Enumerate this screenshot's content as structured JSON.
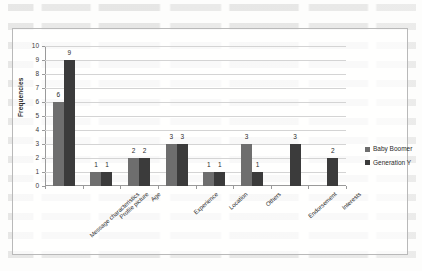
{
  "background": {
    "ghost_text_visible": true,
    "ghost_line_count": 14
  },
  "legend": {
    "position": "right",
    "entries": [
      {
        "label": "Baby Boomer",
        "color": "#6e6e6e",
        "icon": "legend-swatch-icon"
      },
      {
        "label": "Generation Y",
        "color": "#3b3b3b",
        "icon": "legend-swatch-icon"
      }
    ]
  },
  "axes": {
    "ylabel": "Frequencies",
    "yticks": [
      "0",
      "1",
      "2",
      "3",
      "4",
      "5",
      "6",
      "7",
      "8",
      "9",
      "10"
    ]
  },
  "chart_data": {
    "type": "bar",
    "title": "",
    "xlabel": "",
    "ylabel": "Frequencies",
    "ylim": [
      0,
      10
    ],
    "grid": true,
    "legend_position": "right",
    "categories": [
      "Message characteristics",
      "Profile picture",
      "Age",
      "Experience",
      "Location",
      "Others",
      "Endorsement",
      "Interests"
    ],
    "series": [
      {
        "name": "Baby Boomer",
        "color": "#6e6e6e",
        "values": [
          6,
          1,
          2,
          3,
          1,
          3,
          0,
          0
        ],
        "labels": [
          "6",
          "1",
          "2",
          "3",
          "1",
          "3",
          "",
          ""
        ]
      },
      {
        "name": "Generation Y",
        "color": "#3b3b3b",
        "values": [
          9,
          1,
          2,
          3,
          1,
          1,
          3,
          2
        ],
        "labels": [
          "9",
          "1",
          "2",
          "3",
          "1",
          "1",
          "3",
          "2"
        ]
      }
    ]
  }
}
